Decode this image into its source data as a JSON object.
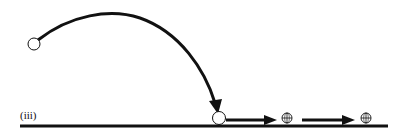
{
  "diagram": {
    "panel_label": "(iii)",
    "colors": {
      "stroke": "#111111",
      "background": "#ffffff",
      "ball_fill": "#ffffff"
    },
    "elements": {
      "ground": "ground-line",
      "start_ball": "hollow-circle",
      "trajectory": "curved-arrow",
      "landed_ball": "hollow-circle",
      "arrow_1": "right-arrow",
      "globe_1": "globe-icon",
      "arrow_2": "right-arrow",
      "globe_2": "globe-icon"
    }
  }
}
